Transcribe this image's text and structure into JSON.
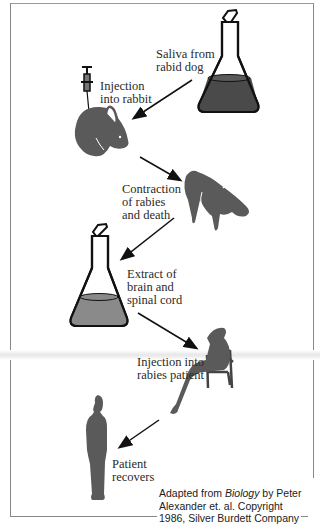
{
  "diagram": {
    "steps": [
      {
        "id": "saliva",
        "label": "Saliva from\nrabid dog"
      },
      {
        "id": "injection-rabbit",
        "label": "Injection\ninto rabbit"
      },
      {
        "id": "contraction",
        "label": "Contraction\nof rabies\nand death"
      },
      {
        "id": "extract",
        "label": "Extract of\nbrain and\nspinal cord"
      },
      {
        "id": "injection-patient",
        "label": "Injection into\nrabies patient"
      },
      {
        "id": "recovers",
        "label": "Patient\nrecovers"
      }
    ],
    "credit": {
      "prefix": "Adapted from ",
      "book": "Biology",
      "suffix": " by Peter",
      "line2": "Alexander et. al. Copyright",
      "line3": "1986, Silver Burdett Company"
    },
    "colors": {
      "fill": "#5a5a5a",
      "liquid_dark": "#4a4a4a",
      "liquid_light": "#8a8a8a",
      "stroke": "#111111"
    }
  }
}
